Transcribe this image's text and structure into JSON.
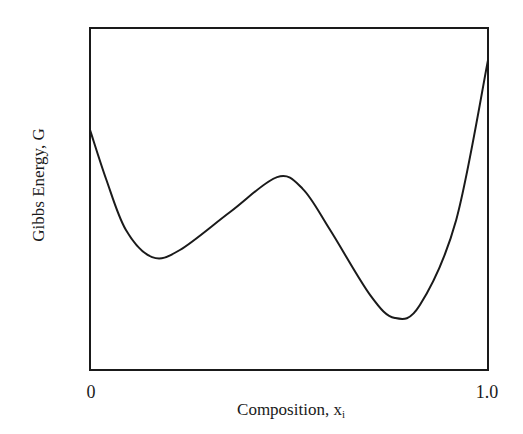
{
  "chart_data": {
    "type": "line",
    "title": "",
    "xlabel": "Composition, x",
    "xlabel_subscript": "i",
    "ylabel": "Gibbs Energy, G",
    "xlim": [
      0,
      1.0
    ],
    "ylim": [
      0,
      1
    ],
    "x_ticks": [
      "0",
      "1.0"
    ],
    "y_ticks": [],
    "grid": false,
    "legend": null,
    "y_units": "relative (no numeric y-axis scale shown)",
    "series": [
      {
        "name": "G(x)",
        "x": [
          0.0,
          0.04,
          0.09,
          0.156,
          0.226,
          0.352,
          0.47,
          0.535,
          0.603,
          0.704,
          0.766,
          0.829,
          0.92,
          1.0
        ],
        "values": [
          0.702,
          0.56,
          0.41,
          0.33,
          0.351,
          0.462,
          0.564,
          0.529,
          0.41,
          0.219,
          0.152,
          0.19,
          0.439,
          0.906
        ]
      }
    ],
    "annotations": []
  },
  "axes": {
    "x_tick_left": "0",
    "x_tick_right": "1.0",
    "x_title": "Composition, x",
    "x_title_sub": "i",
    "y_title": "Gibbs Energy, G"
  },
  "style": {
    "line_color": "#1a1a1a",
    "frame_color": "#1a1a1a",
    "background": "#ffffff"
  }
}
